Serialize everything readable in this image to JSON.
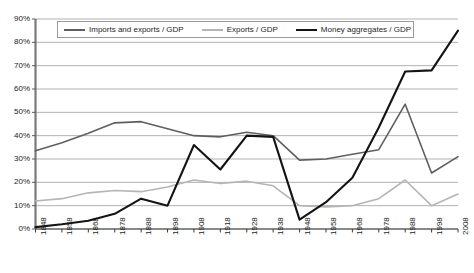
{
  "chart_data": {
    "type": "line",
    "title": "",
    "subtitle": "",
    "xlabel": "",
    "ylabel": "",
    "grid": true,
    "legend_position": "top-inside",
    "ylim": [
      0,
      90
    ],
    "ytick_labels": [
      "0%",
      "10%",
      "20%",
      "30%",
      "40%",
      "50%",
      "60%",
      "70%",
      "80%",
      "90%"
    ],
    "ytick_values": [
      0,
      10,
      20,
      30,
      40,
      50,
      60,
      70,
      80,
      90
    ],
    "categories": [
      "1848",
      "1858",
      "1868",
      "1878",
      "1888",
      "1898",
      "1908",
      "1918",
      "1928",
      "1938",
      "1948",
      "1958",
      "1968",
      "1978",
      "1988",
      "1998",
      "2008"
    ],
    "x": [
      1848,
      1858,
      1868,
      1878,
      1888,
      1898,
      1908,
      1918,
      1928,
      1938,
      1948,
      1958,
      1968,
      1978,
      1988,
      1998,
      2008
    ],
    "series": [
      {
        "name": "Imports and exports / GDP",
        "color": "#5f5f5f",
        "width": 1.6,
        "values": [
          33.5,
          37.0,
          41.0,
          45.5,
          46.0,
          43.0,
          40.0,
          39.5,
          41.5,
          40.0,
          29.5,
          30.0,
          32.0,
          34.0,
          53.5,
          24.0,
          31.0
        ]
      },
      {
        "name": "Exports / GDP",
        "color": "#b5b5b5",
        "width": 1.6,
        "values": [
          12.0,
          13.0,
          15.5,
          16.5,
          16.0,
          18.0,
          21.0,
          19.5,
          20.5,
          18.5,
          10.0,
          9.5,
          10.0,
          13.0,
          21.0,
          10.0,
          15.0
        ]
      },
      {
        "name": "Money aggregates / GDP",
        "color": "#141414",
        "width": 2.1,
        "values": [
          0.8,
          2.0,
          3.5,
          6.5,
          13.0,
          10.0,
          36.0,
          25.5,
          40.0,
          39.5,
          4.0,
          11.5,
          22.0,
          43.5,
          67.5,
          68.0,
          85.0
        ]
      }
    ]
  },
  "legend": {
    "items": [
      {
        "label": "Imports and exports / GDP",
        "color": "#5f5f5f",
        "swatch": "legend-line-imports-exports"
      },
      {
        "label": "Exports / GDP",
        "color": "#b5b5b5",
        "swatch": "legend-line-exports"
      },
      {
        "label": "Money aggregates / GDP",
        "color": "#141414",
        "swatch": "legend-line-money"
      }
    ]
  }
}
